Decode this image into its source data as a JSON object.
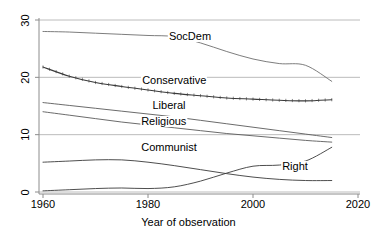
{
  "chart_data": {
    "type": "line",
    "title": "",
    "subtitle": "",
    "xlabel": "Year of observation",
    "ylabel": "",
    "xlim": [
      1960,
      2020
    ],
    "ylim": [
      0,
      30
    ],
    "xticks": [
      1960,
      1980,
      2000,
      2020
    ],
    "yticks": [
      0,
      10,
      20,
      30
    ],
    "xtick_labels": [
      "1960",
      "1980",
      "2000",
      "2020"
    ],
    "ytick_labels": [
      "0",
      "10",
      "20",
      "30"
    ],
    "grid": "horizontal",
    "grid_color": "#b4b4b4",
    "legend": "inline-labels",
    "axis_color": "#8c8c8c",
    "line_color": "#4d4d4d",
    "background": "#ffffff",
    "x": [
      1960,
      1965,
      1970,
      1975,
      1980,
      1985,
      1990,
      1995,
      2000,
      2005,
      2010,
      2015
    ],
    "series": [
      {
        "name": "SocDem",
        "label": "SocDem",
        "color": "#6e6e6e",
        "values": [
          28.0,
          27.9,
          27.7,
          27.5,
          27.3,
          27.1,
          26.0,
          24.5,
          23.2,
          22.4,
          22.1,
          19.3
        ]
      },
      {
        "name": "Conservative",
        "label": "Conservative",
        "color": "#3a3a3a",
        "rug": true,
        "values": [
          21.8,
          20.2,
          19.1,
          18.4,
          17.8,
          17.2,
          16.8,
          16.4,
          16.2,
          16.0,
          15.9,
          16.1
        ]
      },
      {
        "name": "Liberal",
        "label": "Liberal",
        "color": "#5a5a5a",
        "values": [
          15.6,
          15.1,
          14.6,
          14.1,
          13.6,
          13.1,
          12.5,
          11.9,
          11.3,
          10.7,
          10.1,
          9.5
        ]
      },
      {
        "name": "Religious",
        "label": "Religious",
        "color": "#5a5a5a",
        "values": [
          14.0,
          13.4,
          12.8,
          12.2,
          11.7,
          11.2,
          10.7,
          10.2,
          9.8,
          9.4,
          9.0,
          8.7
        ]
      },
      {
        "name": "Communist",
        "label": "Communist",
        "color": "#3a3a3a",
        "values": [
          5.2,
          5.4,
          5.6,
          5.6,
          5.2,
          4.6,
          3.9,
          3.2,
          2.6,
          2.2,
          2.0,
          2.0
        ]
      },
      {
        "name": "Right",
        "label": "Right",
        "color": "#3a3a3a",
        "values": [
          0.2,
          0.4,
          0.6,
          0.7,
          0.6,
          0.9,
          1.9,
          3.3,
          4.5,
          4.7,
          5.4,
          7.8
        ]
      }
    ],
    "series_label_positions": [
      {
        "name": "SocDem",
        "x": 1988,
        "y": 27.0
      },
      {
        "name": "Conservative",
        "x": 1985,
        "y": 19.3
      },
      {
        "name": "Liberal",
        "x": 1984,
        "y": 15.0
      },
      {
        "name": "Religious",
        "x": 1983,
        "y": 12.2
      },
      {
        "name": "Communist",
        "x": 1984,
        "y": 7.6
      },
      {
        "name": "Right",
        "x": 2008,
        "y": 4.3
      }
    ]
  }
}
